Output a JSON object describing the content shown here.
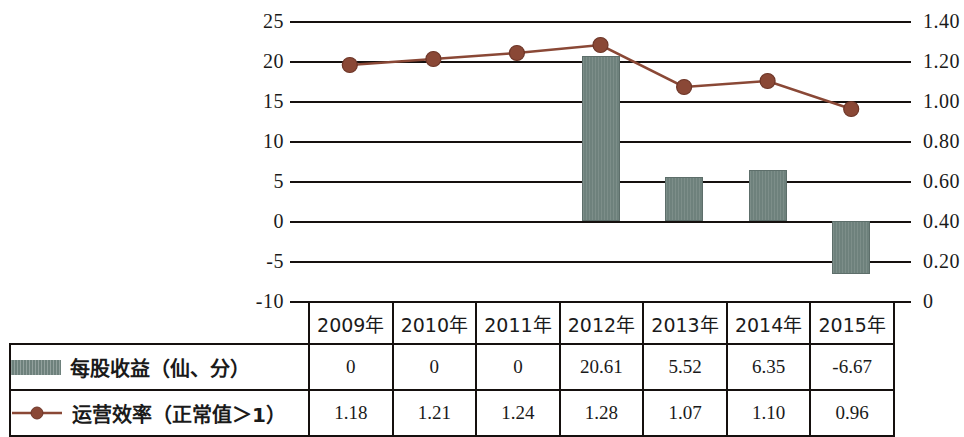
{
  "chart_data": {
    "type": "bar",
    "title": "",
    "categories": [
      "2009年",
      "2010年",
      "2011年",
      "2012年",
      "2013年",
      "2014年",
      "2015年"
    ],
    "xlabel": "",
    "grid": true,
    "legend_position": "table-left",
    "axes": {
      "left": {
        "label": "",
        "ylim": [
          -10,
          25
        ],
        "ticks": [
          "25",
          "20",
          "15",
          "10",
          "5",
          "0",
          "-5",
          "-10"
        ],
        "tick_values": [
          25,
          20,
          15,
          10,
          5,
          0,
          -5,
          -10
        ]
      },
      "right": {
        "label": "",
        "ylim": [
          0,
          1.4
        ],
        "ticks": [
          "1.40",
          "1.20",
          "1.00",
          "0.80",
          "0.60",
          "0.40",
          "0.20",
          "0"
        ],
        "tick_values": [
          1.4,
          1.2,
          1.0,
          0.8,
          0.6,
          0.4,
          0.2,
          0
        ]
      }
    },
    "series": [
      {
        "name": "每股收益（仙、分）",
        "type": "bar",
        "axis": "left",
        "color": "#6e817c",
        "values": [
          0,
          0,
          0,
          20.61,
          5.52,
          6.35,
          -6.67
        ],
        "value_labels": [
          "0",
          "0",
          "0",
          "20.61",
          "5.52",
          "6.35",
          "-6.67"
        ]
      },
      {
        "name": "运营效率（正常值＞1）",
        "type": "line",
        "axis": "right",
        "color": "#8a4836",
        "marker": "circle",
        "values": [
          1.18,
          1.21,
          1.24,
          1.28,
          1.07,
          1.1,
          0.96
        ],
        "value_labels": [
          "1.18",
          "1.21",
          "1.24",
          "1.28",
          "1.07",
          "1.10",
          "0.96"
        ]
      }
    ]
  },
  "table": {
    "header_corner": "",
    "columns": [
      "2009年",
      "2010年",
      "2011年",
      "2012年",
      "2013年",
      "2014年",
      "2015年"
    ],
    "rows": [
      {
        "legend_icon": "bar-swatch-icon",
        "label": "每股收益（仙、分）",
        "values": [
          "0",
          "0",
          "0",
          "20.61",
          "5.52",
          "6.35",
          "-6.67"
        ]
      },
      {
        "legend_icon": "line-marker-icon",
        "label": "运营效率（正常值＞1）",
        "values": [
          "1.18",
          "1.21",
          "1.24",
          "1.28",
          "1.07",
          "1.10",
          "0.96"
        ]
      }
    ]
  },
  "colors": {
    "bar": "#6e817c",
    "line": "#8a4836",
    "axis": "#15100e",
    "background": "#ffffff"
  }
}
